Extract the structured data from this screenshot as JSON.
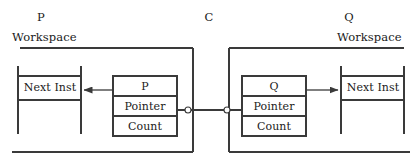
{
  "diagram": {
    "title_labels": {
      "left_process": "P",
      "center_object": "C",
      "right_process": "Q"
    },
    "workspaces": [
      {
        "id": "left-workspace",
        "label": "Workspace",
        "owner": "P",
        "slot_label": "Next Inst"
      },
      {
        "id": "right-workspace",
        "label": "Workspace",
        "owner": "Q",
        "slot_label": "Next Inst"
      }
    ],
    "descriptors": [
      {
        "id": "p-descriptor",
        "rows": [
          "P",
          "Pointer",
          "Count"
        ]
      },
      {
        "id": "q-descriptor",
        "rows": [
          "Q",
          "Pointer",
          "Count"
        ]
      }
    ],
    "junctions": [
      {
        "id": "left-junction",
        "x": 188,
        "y": 110
      },
      {
        "id": "right-junction",
        "x": 227,
        "y": 110
      }
    ],
    "arrows": [
      {
        "id": "p-to-next-inst",
        "direction": "left",
        "from": "p-descriptor",
        "to": "left-workspace-next-inst"
      },
      {
        "id": "q-to-next-inst",
        "direction": "right",
        "from": "q-descriptor",
        "to": "right-workspace-next-inst"
      }
    ],
    "colors": {
      "stroke": "#3a3a3a",
      "text": "#1a1a1a",
      "background": "#ffffff"
    }
  }
}
